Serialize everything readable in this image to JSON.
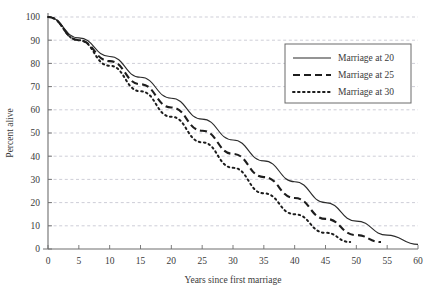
{
  "chart_data": {
    "type": "line",
    "title": "",
    "xlabel": "Years since first marriage",
    "ylabel": "Percent alive",
    "xlim": [
      0,
      60
    ],
    "ylim": [
      0,
      100
    ],
    "xticks": [
      0,
      5,
      10,
      15,
      20,
      25,
      30,
      35,
      40,
      45,
      50,
      55,
      60
    ],
    "yticks": [
      0,
      10,
      20,
      30,
      40,
      50,
      60,
      70,
      80,
      90,
      100
    ],
    "grid": "horizontal-dashed",
    "legend_position": "upper-right",
    "series": [
      {
        "name": "Marriage at 20",
        "style": "solid",
        "x": [
          0,
          5,
          10,
          15,
          20,
          25,
          30,
          35,
          40,
          45,
          50,
          55,
          60
        ],
        "values": [
          100,
          91,
          83,
          74,
          65,
          56,
          47,
          38,
          29,
          20,
          12,
          6,
          2
        ]
      },
      {
        "name": "Marriage at 25",
        "style": "dashed",
        "x": [
          0,
          5,
          10,
          15,
          20,
          25,
          30,
          35,
          40,
          45,
          50,
          54
        ],
        "values": [
          100,
          90,
          81,
          71,
          61,
          51,
          41,
          31,
          22,
          13,
          6,
          3
        ]
      },
      {
        "name": "Marriage at 30",
        "style": "dotted",
        "x": [
          0,
          5,
          10,
          15,
          20,
          25,
          30,
          35,
          40,
          45,
          49
        ],
        "values": [
          100,
          90,
          79,
          68,
          57,
          46,
          35,
          24,
          15,
          7,
          3
        ]
      }
    ]
  },
  "axis": {
    "ylabel": "Percent alive",
    "xlabel": "Years since first marriage",
    "xticklabels": [
      "0",
      "5",
      "10",
      "15",
      "20",
      "25",
      "30",
      "35",
      "40",
      "45",
      "50",
      "55",
      "60"
    ],
    "yticklabels": [
      "0",
      "10",
      "20",
      "30",
      "40",
      "50",
      "60",
      "70",
      "80",
      "90",
      "100"
    ]
  },
  "legend": {
    "entries": [
      {
        "label": "Marriage at 20",
        "style": "solid"
      },
      {
        "label": "Marriage at 25",
        "style": "dashed"
      },
      {
        "label": "Marriage at 30",
        "style": "dotted"
      }
    ]
  },
  "colors": {
    "line": "#1d1d1d",
    "grid": "#b9b9c6",
    "axis": "#6e6e6e",
    "text": "#3a3a3a",
    "background": "#ffffff"
  }
}
